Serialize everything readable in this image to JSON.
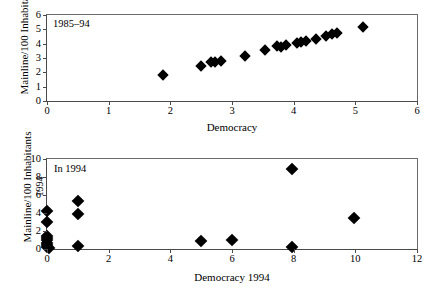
{
  "figure": {
    "background": "#ffffff",
    "marker_color": "#000000",
    "axis_color": "#4a4a4a"
  },
  "chart_data": [
    {
      "type": "scatter",
      "id": "top",
      "title": "",
      "annotation": "1985–94",
      "xlabel": "Democracy",
      "ylabel": "Mainline/100 Inhabitants",
      "ylabel_line2": "",
      "xlim": [
        0,
        6
      ],
      "ylim": [
        0,
        6
      ],
      "xticks": [
        0,
        1,
        2,
        3,
        4,
        5,
        6
      ],
      "yticks": [
        0,
        1,
        2,
        3,
        4,
        5,
        6
      ],
      "xticklabels": [
        "0",
        "1",
        "2",
        "3",
        "4",
        "5",
        "6"
      ],
      "yticklabels": [
        "0",
        "1",
        "2",
        "3",
        "4",
        "5",
        "6"
      ],
      "grid": false,
      "legend": "none",
      "marker": "diamond",
      "points": [
        {
          "x": 1.88,
          "y": 1.83
        },
        {
          "x": 2.5,
          "y": 2.45
        },
        {
          "x": 2.66,
          "y": 2.71
        },
        {
          "x": 2.72,
          "y": 2.7
        },
        {
          "x": 2.82,
          "y": 2.78
        },
        {
          "x": 3.21,
          "y": 3.17
        },
        {
          "x": 3.53,
          "y": 3.56
        },
        {
          "x": 3.73,
          "y": 3.85
        },
        {
          "x": 3.8,
          "y": 3.78
        },
        {
          "x": 3.87,
          "y": 3.92
        },
        {
          "x": 4.05,
          "y": 4.08
        },
        {
          "x": 4.12,
          "y": 4.14
        },
        {
          "x": 4.2,
          "y": 4.18
        },
        {
          "x": 4.36,
          "y": 4.3
        },
        {
          "x": 4.52,
          "y": 4.54
        },
        {
          "x": 4.62,
          "y": 4.64
        },
        {
          "x": 4.7,
          "y": 4.72
        },
        {
          "x": 5.13,
          "y": 5.13
        }
      ]
    },
    {
      "type": "scatter",
      "id": "bottom",
      "title": "",
      "annotation": "In 1994",
      "xlabel": "Democracy 1994",
      "ylabel": "Mainline/100 Inhabitants",
      "ylabel_line2": "1994",
      "xlim": [
        0,
        12
      ],
      "ylim": [
        0,
        10
      ],
      "xticks": [
        0,
        2,
        4,
        6,
        8,
        10,
        12
      ],
      "yticks": [
        0,
        2,
        4,
        6,
        8,
        10
      ],
      "xticklabels": [
        "0",
        "2",
        "4",
        "6",
        "8",
        "10",
        "12"
      ],
      "yticklabels": [
        "0",
        "2",
        "4",
        "6",
        "8",
        "10"
      ],
      "grid": false,
      "legend": "none",
      "marker": "diamond",
      "points": [
        {
          "x": 0.0,
          "y": 4.25
        },
        {
          "x": 0.0,
          "y": 3.05
        },
        {
          "x": 0.0,
          "y": 1.45
        },
        {
          "x": 0.0,
          "y": 1.2
        },
        {
          "x": 0.0,
          "y": 0.95
        },
        {
          "x": 0.0,
          "y": 0.7
        },
        {
          "x": 0.0,
          "y": 0.45
        },
        {
          "x": 0.0,
          "y": 0.2
        },
        {
          "x": 0.05,
          "y": 0.1
        },
        {
          "x": 1.0,
          "y": 5.35
        },
        {
          "x": 1.0,
          "y": 3.85
        },
        {
          "x": 1.0,
          "y": 0.35
        },
        {
          "x": 5.0,
          "y": 0.9
        },
        {
          "x": 6.0,
          "y": 0.95
        },
        {
          "x": 7.95,
          "y": 8.85
        },
        {
          "x": 7.95,
          "y": 0.2
        },
        {
          "x": 9.95,
          "y": 3.45
        }
      ]
    }
  ]
}
